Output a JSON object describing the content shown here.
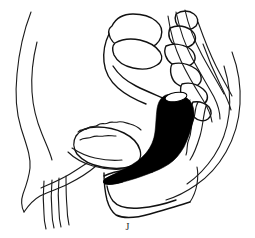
{
  "figure": {
    "caption": "J",
    "modality": "line-drawing",
    "background_color": "#ffffff",
    "line_color": "#111111",
    "fill_color": "#000000",
    "width": 255,
    "height": 238,
    "structures": [
      {
        "name": "abdominal-wall-outer-contour",
        "region": "anterior-left",
        "style": "thin-line",
        "color": "#1a1a1a"
      },
      {
        "name": "abdominal-wall-inner-contour",
        "region": "anterior-left",
        "style": "thin-line",
        "color": "#1a1a1a"
      },
      {
        "name": "uterus-body",
        "region": "central-superior",
        "style": "outline",
        "color": "#111111"
      },
      {
        "name": "uterine-cervix",
        "region": "central",
        "style": "outline",
        "color": "#111111"
      },
      {
        "name": "bladder",
        "region": "central-anterior",
        "style": "outline",
        "color": "#111111"
      },
      {
        "name": "vagina-scalloped-wall",
        "region": "central-inferior-left",
        "style": "outline",
        "color": "#111111"
      },
      {
        "name": "sacrum-vertebral-segments",
        "region": "posterior-right",
        "style": "outline",
        "color": "#111111"
      },
      {
        "name": "sacral-canal",
        "region": "posterior-right",
        "style": "thin-line",
        "color": "#1a1a1a"
      },
      {
        "name": "coccyx",
        "region": "posterior-inferior",
        "style": "outline",
        "color": "#111111"
      },
      {
        "name": "rectum-contrast-filled",
        "region": "central-posterior",
        "style": "solid-fill",
        "color": "#000000"
      },
      {
        "name": "anal-canal",
        "region": "inferior",
        "style": "solid-fill",
        "color": "#000000"
      },
      {
        "name": "rectal-lumen-opening",
        "region": "rectum-superior",
        "style": "white-ellipse",
        "color": "#ffffff"
      },
      {
        "name": "gluteal-outer-contour",
        "region": "posterior-right",
        "style": "thin-line",
        "color": "#1a1a1a"
      },
      {
        "name": "perineum-contour",
        "region": "inferior",
        "style": "thin-line",
        "color": "#1a1a1a"
      },
      {
        "name": "thigh-contour-lines",
        "region": "inferior-left",
        "style": "thin-line",
        "color": "#1a1a1a"
      }
    ]
  }
}
